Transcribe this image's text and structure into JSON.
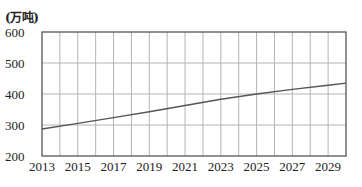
{
  "chart_data": {
    "type": "line",
    "title": "",
    "xlabel": "",
    "ylabel": "(万吨)",
    "xlim": [
      2013,
      2030
    ],
    "ylim": [
      200,
      600
    ],
    "grid": true,
    "legend": null,
    "x_tick_labels": [
      "2013",
      "2015",
      "2017",
      "2019",
      "2021",
      "2023",
      "2025",
      "2027",
      "2029"
    ],
    "y_tick_labels": [
      "200",
      "300",
      "400",
      "500",
      "600"
    ],
    "series": [
      {
        "name": "",
        "x": [
          2013,
          2015,
          2017,
          2019,
          2021,
          2023,
          2025,
          2027,
          2029,
          2030
        ],
        "values": [
          287,
          305,
          324,
          343,
          363,
          383,
          400,
          415,
          428,
          435
        ]
      }
    ]
  },
  "colors": {
    "frame": "#555555",
    "grid": "#b4b4b4",
    "line": "#555555",
    "text": "#222222"
  },
  "layout": {
    "plot_left": 42,
    "plot_right": 346,
    "plot_top": 32,
    "plot_bottom": 156
  }
}
